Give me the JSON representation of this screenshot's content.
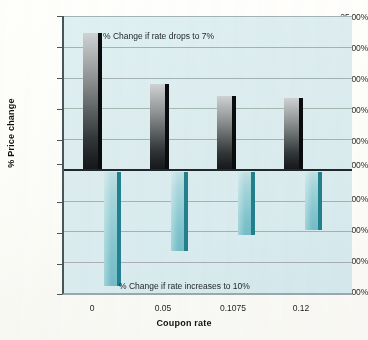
{
  "chart_data": {
    "type": "bar",
    "title": "",
    "xlabel": "Coupon rate",
    "ylabel": "% Price change",
    "categories": [
      "0",
      "0.05",
      "0.1075",
      "0.12"
    ],
    "ylim": [
      -20,
      25
    ],
    "ytick_step": 5,
    "grid": true,
    "legend_position": "annotations-inside-plot",
    "series": [
      {
        "name": "% Change if rate drops to 7%",
        "color": "#3a3f41",
        "values": [
          22.3,
          13.9,
          12.0,
          11.7
        ]
      },
      {
        "name": "% Change if rate increases to 10%",
        "color": "#7fc3cc",
        "values": [
          -18.5,
          -12.8,
          -10.3,
          -9.5
        ]
      }
    ],
    "ytick_labels": [
      "25.00%",
      "20.00%",
      "15.00%",
      "10.00%",
      "5.00%",
      "0.00%",
      "-5.00%",
      "-10.00%",
      "-15.00%",
      "-20.00%"
    ],
    "annotations": [
      {
        "text": "% Change if rate drops to 7%",
        "target": "positive-series"
      },
      {
        "text": "% Change if rate increases to 10%",
        "target": "negative-series"
      }
    ],
    "colors": {
      "plot_background": "#dcecef",
      "gridline": "#8d9ba0",
      "axis": "#20282b",
      "positive_bar": "#3a3f41",
      "negative_bar": "#7fc3cc",
      "page_background": "#fdfdfb"
    }
  }
}
